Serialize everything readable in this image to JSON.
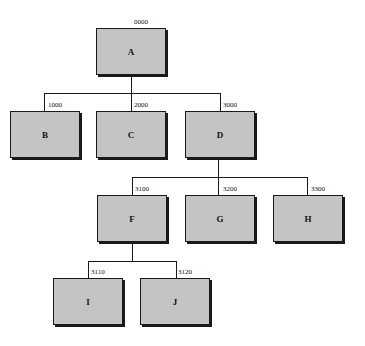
{
  "diagram": {
    "type": "hierarchy-tree",
    "nodes": [
      {
        "id": "A",
        "label": "A",
        "code": "0000",
        "x": 96,
        "y": 28,
        "w": 70,
        "h": 47
      },
      {
        "id": "B",
        "label": "B",
        "code": "1000",
        "x": 10,
        "y": 111,
        "w": 70,
        "h": 47
      },
      {
        "id": "C",
        "label": "C",
        "code": "2000",
        "x": 96,
        "y": 111,
        "w": 70,
        "h": 47
      },
      {
        "id": "D",
        "label": "D",
        "code": "3000",
        "x": 185,
        "y": 111,
        "w": 70,
        "h": 47
      },
      {
        "id": "F",
        "label": "F",
        "code": "3100",
        "x": 97,
        "y": 195,
        "w": 70,
        "h": 47
      },
      {
        "id": "G",
        "label": "G",
        "code": "3200",
        "x": 185,
        "y": 195,
        "w": 70,
        "h": 47
      },
      {
        "id": "H",
        "label": "H",
        "code": "3300",
        "x": 273,
        "y": 195,
        "w": 70,
        "h": 47
      },
      {
        "id": "I",
        "label": "I",
        "code": "3110",
        "x": 53,
        "y": 278,
        "w": 70,
        "h": 47
      },
      {
        "id": "J",
        "label": "J",
        "code": "3120",
        "x": 140,
        "y": 278,
        "w": 70,
        "h": 47
      }
    ],
    "edges": [
      [
        "A",
        "B"
      ],
      [
        "A",
        "C"
      ],
      [
        "A",
        "D"
      ],
      [
        "D",
        "F"
      ],
      [
        "D",
        "G"
      ],
      [
        "D",
        "H"
      ],
      [
        "F",
        "I"
      ],
      [
        "F",
        "J"
      ]
    ]
  }
}
